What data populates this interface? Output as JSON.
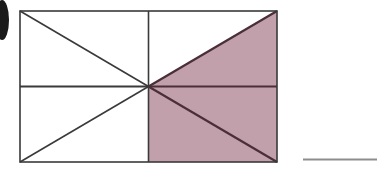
{
  "figure": {
    "title": "",
    "caption": "",
    "marker": {
      "name": "item-bullet-marker",
      "label": "",
      "shape": "ellipse",
      "color": "#1a1a1a",
      "cx": 2,
      "cy": 20,
      "rx": 7,
      "ry": 20,
      "clipped": true
    },
    "rectangle": {
      "x": 20,
      "y": 11,
      "width": 257,
      "height": 151,
      "stroke": "#3a3a3a",
      "stroke_width": 1.6,
      "fill": "#ffffff"
    },
    "center_point": {
      "x": 148.5,
      "y": 86.5
    },
    "midlines": [
      {
        "name": "vertical-midline",
        "x1": 148.5,
        "y1": 11,
        "x2": 148.5,
        "y2": 162
      },
      {
        "name": "horizontal-midline-left",
        "x1": 20,
        "y1": 86.5,
        "x2": 148.5,
        "y2": 86.5
      },
      {
        "name": "horizontal-midline-right",
        "x1": 148.5,
        "y1": 86.5,
        "x2": 277,
        "y2": 86.5
      }
    ],
    "diagonals": [
      {
        "name": "diagonal-center-to-top-left",
        "x1": 148.5,
        "y1": 86.5,
        "x2": 20,
        "y2": 11
      },
      {
        "name": "diagonal-center-to-bottom-left",
        "x1": 148.5,
        "y1": 86.5,
        "x2": 20,
        "y2": 162
      },
      {
        "name": "diagonal-center-to-top-right",
        "x1": 148.5,
        "y1": 86.5,
        "x2": 277,
        "y2": 11
      },
      {
        "name": "diagonal-center-to-bottom-right",
        "x1": 148.5,
        "y1": 86.5,
        "x2": 277,
        "y2": 162
      }
    ],
    "shaded_regions": [
      {
        "name": "shaded-triangle-upper-right",
        "points": "148.5,86.5 277,11 277,86.5",
        "fill": "#c2a0ab"
      },
      {
        "name": "shaded-rect-lower-right",
        "points": "148.5,86.5 277,86.5 277,162 148.5,162",
        "fill": "#c2a0ab"
      }
    ],
    "shaded_outline_color": "#4a2f38",
    "line_color": "#3a3a3a",
    "rule": {
      "name": "horizontal-rule",
      "x1": 303,
      "y1": 159.5,
      "x2": 377,
      "y2": 159.5,
      "color": "#8d8d8d",
      "thickness": 2
    }
  }
}
